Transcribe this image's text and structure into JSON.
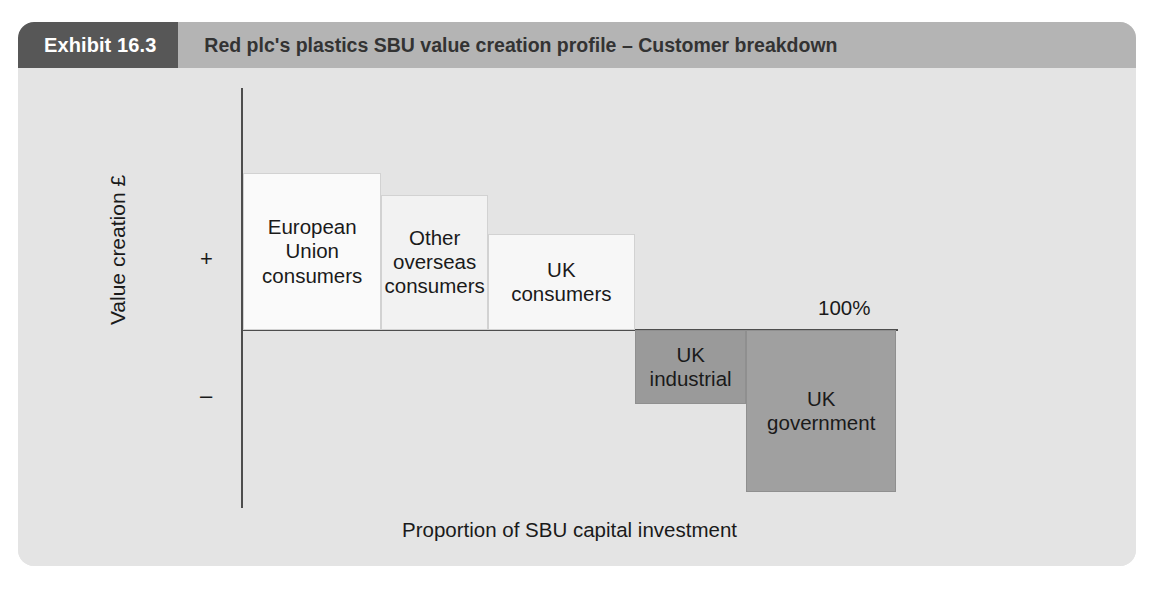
{
  "header": {
    "badge": "Exhibit 16.3",
    "title": "Red plc's plastics SBU value creation profile – Customer breakdown"
  },
  "colors": {
    "panel_background": "#e6e6e6",
    "header_strip": "#b4b4b4",
    "badge_background": "#575757",
    "plot_background": "#e4e4e4",
    "axis": "#4d4d4d",
    "positive_bar_1": "#fafafa",
    "positive_bar_2": "#f2f2f2",
    "positive_bar_3": "#f7f7f7",
    "negative_bar_1": "#9a9a9a",
    "negative_bar_2": "#a0a0a0"
  },
  "chart_data": {
    "type": "bar",
    "title": "Red plc's plastics SBU value creation profile – Customer breakdown",
    "subtitle": "",
    "xlabel": "Proportion of SBU capital investment",
    "ylabel": "Value creation £",
    "ytick_labels": [
      "+",
      "–"
    ],
    "xaxis_end_label": "100%",
    "grid": false,
    "legend": false,
    "note": "Value-creation profile: bar widths are the share of SBU capital investment (cumulative to 100%); bar heights are value created (above axis) or destroyed (below axis).",
    "categories": [
      "European Union consumers",
      "Other overseas consumers",
      "UK consumers",
      "UK industrial",
      "UK government"
    ],
    "bars": [
      {
        "label": "European Union consumers",
        "label_lines": [
          "European",
          "Union",
          "consumers"
        ],
        "sign": "positive",
        "capital_share_pct": 21.2,
        "cumulative_start_pct": 0.0,
        "cumulative_end_pct": 21.2,
        "value_creation": 160,
        "fill": "#fafafa"
      },
      {
        "label": "Other overseas consumers",
        "label_lines": [
          "Other",
          "overseas",
          "consumers"
        ],
        "sign": "positive",
        "capital_share_pct": 16.3,
        "cumulative_start_pct": 21.2,
        "cumulative_end_pct": 37.5,
        "value_creation": 138,
        "fill": "#f2f2f2"
      },
      {
        "label": "UK consumers",
        "label_lines": [
          "UK",
          "consumers"
        ],
        "sign": "positive",
        "capital_share_pct": 22.5,
        "cumulative_start_pct": 37.5,
        "cumulative_end_pct": 60.0,
        "value_creation": 98,
        "fill": "#f7f7f7"
      },
      {
        "label": "UK industrial",
        "label_lines": [
          "UK",
          "industrial"
        ],
        "sign": "negative",
        "capital_share_pct": 17.1,
        "cumulative_start_pct": 60.0,
        "cumulative_end_pct": 77.1,
        "value_creation": -75,
        "fill": "#9a9a9a"
      },
      {
        "label": "UK government",
        "label_lines": [
          "UK",
          "government"
        ],
        "sign": "negative",
        "capital_share_pct": 22.9,
        "cumulative_start_pct": 77.1,
        "cumulative_end_pct": 100.0,
        "value_creation": -165,
        "fill": "#a0a0a0"
      }
    ]
  }
}
